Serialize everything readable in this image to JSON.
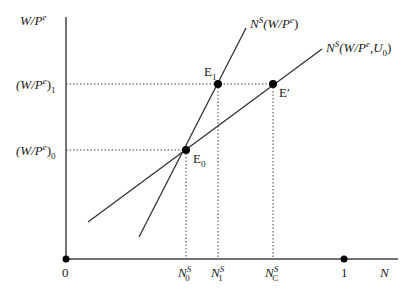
{
  "axes": {
    "y_label": "W/P",
    "y_label_sup": "e",
    "x_label": "N",
    "origin_label": "0",
    "x_max_label": "1"
  },
  "y_ticks": [
    {
      "base": "(W/P",
      "sup": "e",
      "close": ")",
      "sub": "1"
    },
    {
      "base": "(W/P",
      "sup": "e",
      "close": ")",
      "sub": "0"
    }
  ],
  "x_ticks": [
    {
      "base": "N",
      "sup": "S",
      "sub": "0"
    },
    {
      "base": "N",
      "sup": "S",
      "sub": "1"
    },
    {
      "base": "N",
      "sup": "S",
      "sub": "C"
    }
  ],
  "curves": [
    {
      "name": "N",
      "sup": "S",
      "args": "(W/P",
      "args_sup": "e",
      "args_close": ")"
    },
    {
      "name": "N",
      "sup": "S",
      "args": "(W/P",
      "args_sup": "e",
      "args_mid": ",U",
      "args_sub": "0",
      "args_close": ")"
    }
  ],
  "points": [
    {
      "label": "E",
      "sub": "0"
    },
    {
      "label": "E",
      "sub": "1"
    },
    {
      "label": "E′",
      "sub": ""
    }
  ],
  "colors": {
    "line": "#333333",
    "point": "#000000"
  }
}
